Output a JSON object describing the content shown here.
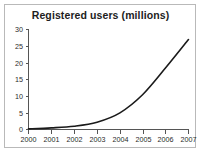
{
  "chart_data": {
    "type": "line",
    "title": "Registered users (millions)",
    "xlabel": "",
    "ylabel": "",
    "x": [
      2000,
      2001,
      2002,
      2003,
      2004,
      2005,
      2006,
      2007
    ],
    "categories": [
      "2000",
      "2001",
      "2002",
      "2003",
      "2004",
      "2005",
      "2006",
      "2007"
    ],
    "values": [
      0.2,
      0.5,
      1.0,
      2.2,
      5.0,
      10.5,
      18.5,
      27.0
    ],
    "series": [
      {
        "name": "Registered users",
        "values": [
          0.2,
          0.5,
          1.0,
          2.2,
          5.0,
          10.5,
          18.5,
          27.0
        ],
        "color": "#1a1a1a"
      }
    ],
    "xlim": [
      2000,
      2007
    ],
    "ylim": [
      0,
      30
    ],
    "ytick_labels": [
      "0",
      "5",
      "10",
      "15",
      "20",
      "25",
      "30"
    ],
    "ytick_values": [
      0,
      5,
      10,
      15,
      20,
      25,
      30
    ],
    "xtick_labels": [
      "2000",
      "2001",
      "2002",
      "2003",
      "2004",
      "2005",
      "2006",
      "2007"
    ],
    "grid": false,
    "legend": false,
    "legend_position": "none",
    "annotations": []
  },
  "figure": {
    "title": "Registered users (millions)",
    "border_color": "#b9b9b9",
    "background_color": "#ffffff",
    "axis_color": "#555555",
    "line_color": "#1a1a1a"
  }
}
